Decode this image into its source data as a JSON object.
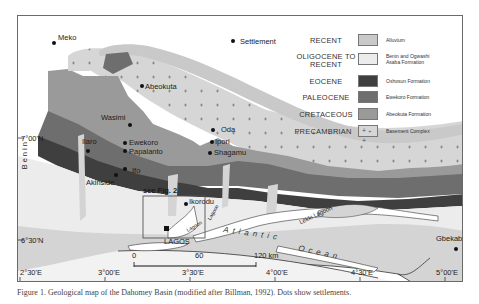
{
  "map": {
    "title": "Geological map of the Dahomey Basin (Nigeria sector)",
    "country_label": "Benin",
    "inset_label": "see Fig. 2",
    "water_labels": {
      "ocean_word1": "Atlantic",
      "ocean_word2": "Ocean",
      "lekki_lagoon": "Lekki Lagoon",
      "lagoon_1": "Lagoon",
      "lagoon_2": "Lagoon"
    },
    "settlements": [
      {
        "name": "Meko",
        "x": 52,
        "y": 40
      },
      {
        "name": "Abeokuta",
        "x": 140,
        "y": 85
      },
      {
        "name": "Wasimi",
        "x": 127,
        "y": 123
      },
      {
        "name": "Ilaro",
        "x": 86,
        "y": 150
      },
      {
        "name": "Ewekoro",
        "x": 123,
        "y": 142
      },
      {
        "name": "Papalanto",
        "x": 122,
        "y": 150
      },
      {
        "name": "Ifo",
        "x": 122,
        "y": 168
      },
      {
        "name": "Akinside",
        "x": 113,
        "y": 175
      },
      {
        "name": "Oda",
        "x": 211,
        "y": 128
      },
      {
        "name": "Ipori",
        "x": 209,
        "y": 141
      },
      {
        "name": "Shagamu",
        "x": 207,
        "y": 151
      },
      {
        "name": "Ikorodu",
        "x": 184,
        "y": 203
      },
      {
        "name": "Gbekabo",
        "x": 454,
        "y": 248
      }
    ],
    "city_major": {
      "name": "LAGOS"
    },
    "lat_labels": [
      "7°00'N",
      "6°30'N"
    ],
    "lon_labels": [
      "2°30'E",
      "3°00'E",
      "3°30'E",
      "4°00'E",
      "4°30'E",
      "5°00'E"
    ],
    "scale_bar": {
      "ticks": [
        "0",
        "60",
        "120 km"
      ]
    }
  },
  "legend": {
    "settlement_label": "Settlement",
    "items": [
      {
        "age": "RECENT",
        "formation": "Alluvium",
        "color": "#c9c9c9",
        "pattern": "none"
      },
      {
        "age": "OLIGOCENE TO RECENT",
        "formation": "Benin and Ogwashi Asaba Formation",
        "color": "#ececec",
        "pattern": "none"
      },
      {
        "age": "EOCENE",
        "formation": "Oshosun Formation",
        "color": "#3f3f3f",
        "pattern": "none"
      },
      {
        "age": "PALEOCENE",
        "formation": "Ewekoro Formation",
        "color": "#6e6e6e",
        "pattern": "none"
      },
      {
        "age": "CRETACEOUS",
        "formation": "Abeokuta Formation",
        "color": "#9a9a9a",
        "pattern": "none"
      },
      {
        "age": "PRECAMBRIAN",
        "formation": "Basement Complex",
        "color": "#d6d6d6",
        "pattern": "crosses"
      }
    ]
  },
  "caption": "Figure 1.  Geological map of the Dahomey Basin (modified after Billman, 1992). Dots show settlements."
}
